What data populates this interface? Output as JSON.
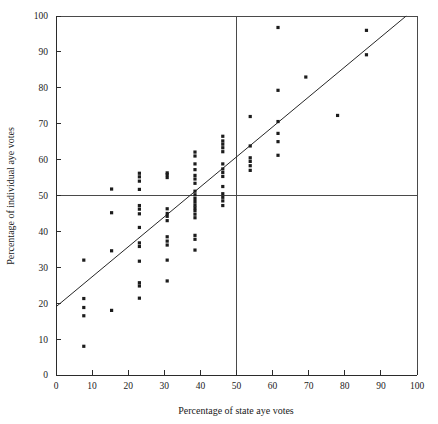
{
  "chart_data": {
    "type": "scatter",
    "title": "",
    "xlabel": "Percentage of state aye votes",
    "ylabel": "Percentage of individual aye votes",
    "xlim": [
      0,
      100
    ],
    "ylim": [
      0,
      100
    ],
    "xticks": [
      0,
      10,
      20,
      30,
      40,
      50,
      60,
      70,
      80,
      90,
      100
    ],
    "yticks": [
      0,
      10,
      20,
      30,
      40,
      50,
      60,
      70,
      80,
      90,
      100
    ],
    "xtick_labels": [
      "0",
      "10",
      "20",
      "30",
      "40",
      "50",
      "60",
      "70",
      "80",
      "90",
      "100"
    ],
    "ytick_labels": [
      "0",
      "10",
      "20",
      "30",
      "40",
      "50",
      "60",
      "70",
      "80",
      "90",
      "100"
    ],
    "grid": false,
    "legend": null,
    "marker": {
      "shape": "square",
      "size": 3.2,
      "color": "#1c1c1c"
    },
    "reference_lines": [
      {
        "name": "vertical-50-percent",
        "orientation": "vertical",
        "value": 50,
        "color": "#4a4a4a"
      },
      {
        "name": "horizontal-50-percent",
        "orientation": "horizontal",
        "value": 50,
        "color": "#4a4a4a"
      }
    ],
    "fit_line": {
      "name": "regression-line",
      "x0": 0,
      "y0": 19,
      "x1": 97,
      "y1": 100,
      "slope": 0.835,
      "intercept": 19,
      "color": "#262626"
    },
    "points": [
      [
        7.7,
        8.0
      ],
      [
        7.7,
        16.5
      ],
      [
        7.7,
        18.8
      ],
      [
        7.7,
        21.3
      ],
      [
        7.7,
        32.0
      ],
      [
        15.4,
        18.0
      ],
      [
        15.4,
        34.6
      ],
      [
        15.4,
        45.2
      ],
      [
        15.4,
        51.8
      ],
      [
        23.1,
        21.4
      ],
      [
        23.1,
        24.8
      ],
      [
        23.1,
        25.7
      ],
      [
        23.1,
        31.7
      ],
      [
        23.1,
        35.8
      ],
      [
        23.1,
        36.8
      ],
      [
        23.1,
        41.1
      ],
      [
        23.1,
        44.9
      ],
      [
        23.1,
        46.2
      ],
      [
        23.1,
        47.2
      ],
      [
        23.1,
        51.7
      ],
      [
        23.1,
        54.0
      ],
      [
        23.1,
        55.2
      ],
      [
        23.1,
        56.2
      ],
      [
        30.8,
        26.2
      ],
      [
        30.8,
        32.0
      ],
      [
        30.8,
        36.2
      ],
      [
        30.8,
        37.3
      ],
      [
        30.8,
        38.5
      ],
      [
        30.8,
        43.0
      ],
      [
        30.8,
        44.2
      ],
      [
        30.8,
        45.0
      ],
      [
        30.8,
        46.3
      ],
      [
        30.8,
        55.0
      ],
      [
        30.8,
        55.8
      ],
      [
        30.8,
        56.3
      ],
      [
        38.5,
        34.8
      ],
      [
        38.5,
        37.8
      ],
      [
        38.5,
        38.9
      ],
      [
        38.5,
        43.8
      ],
      [
        38.5,
        44.8
      ],
      [
        38.5,
        45.8
      ],
      [
        38.5,
        46.6
      ],
      [
        38.5,
        47.4
      ],
      [
        38.5,
        48.3
      ],
      [
        38.5,
        49.2
      ],
      [
        38.5,
        50.2
      ],
      [
        38.5,
        51.2
      ],
      [
        38.5,
        53.4
      ],
      [
        38.5,
        54.6
      ],
      [
        38.5,
        55.6
      ],
      [
        38.5,
        57.2
      ],
      [
        38.5,
        58.8
      ],
      [
        38.5,
        61.0
      ],
      [
        38.5,
        62.1
      ],
      [
        46.2,
        47.2
      ],
      [
        46.2,
        48.5
      ],
      [
        46.2,
        49.5
      ],
      [
        46.2,
        50.5
      ],
      [
        46.2,
        52.5
      ],
      [
        46.2,
        55.3
      ],
      [
        46.2,
        56.4
      ],
      [
        46.2,
        57.4
      ],
      [
        46.2,
        58.8
      ],
      [
        46.2,
        62.2
      ],
      [
        46.2,
        63.3
      ],
      [
        46.2,
        64.3
      ],
      [
        46.2,
        65.2
      ],
      [
        46.2,
        66.5
      ],
      [
        53.8,
        57.0
      ],
      [
        53.8,
        58.3
      ],
      [
        53.8,
        59.5
      ],
      [
        53.8,
        60.5
      ],
      [
        53.8,
        63.8
      ],
      [
        53.8,
        72.0
      ],
      [
        61.5,
        61.2
      ],
      [
        61.5,
        65.0
      ],
      [
        61.5,
        67.3
      ],
      [
        61.5,
        70.6
      ],
      [
        61.5,
        79.3
      ],
      [
        61.5,
        96.8
      ],
      [
        69.2,
        83.0
      ],
      [
        78.0,
        72.3
      ],
      [
        86.0,
        89.2
      ],
      [
        86.0,
        96.0
      ]
    ]
  },
  "geometry": {
    "plot_left": 56,
    "plot_right": 417,
    "plot_top": 16,
    "plot_bottom": 375
  }
}
